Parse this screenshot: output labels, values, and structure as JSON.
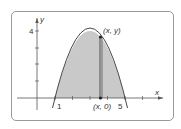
{
  "diagram": {
    "function": "y = 4 - (x - 3)^2",
    "shaded_region": {
      "from_x": 1,
      "to_x": 5,
      "color": "#c9c9c9"
    },
    "axes": {
      "x_label": "x",
      "y_label": "y"
    },
    "y_tick_label": "4",
    "x_tick_labels": {
      "left": "1",
      "right": "5"
    },
    "point_label": "(x, y)",
    "foot_label": "(x, 0)",
    "colors": {
      "curve": "#333333",
      "axis": "#555555",
      "fill": "#c9c9c9",
      "frame": "#9a9a9a"
    }
  }
}
